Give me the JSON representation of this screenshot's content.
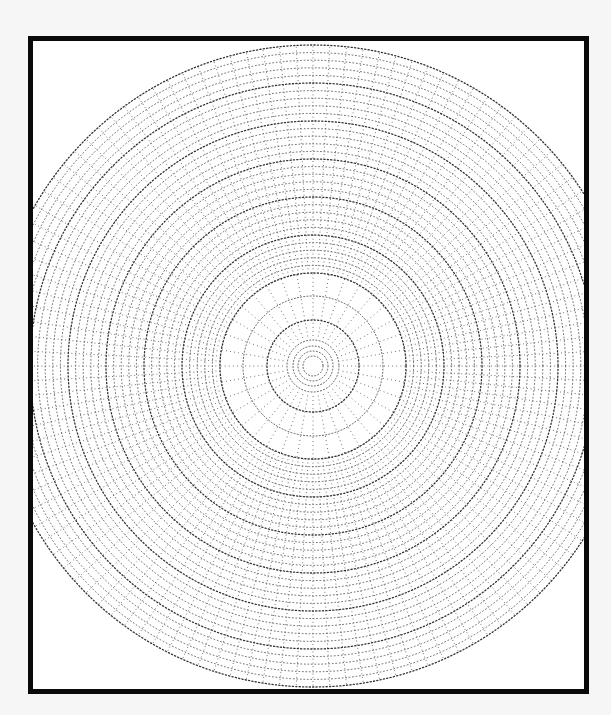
{
  "diagram": {
    "type": "polar-grid",
    "colors": {
      "paper": "#ffffff",
      "background": "#f6f6f6",
      "frame": "#0a0a0a",
      "dots": "#555555",
      "major_dots": "#333333"
    },
    "center": {
      "x": 280,
      "y": 325
    },
    "inner_zone": {
      "radius": 93,
      "radial_count": 36,
      "radial_start": 30,
      "rings": [
        10,
        15,
        20,
        26,
        46,
        70,
        93
      ]
    },
    "outer_zone": {
      "start_radius": 93,
      "end_radius": 322,
      "radial_count": 120,
      "ring_step": 7.6,
      "major_ring_every": 5
    }
  }
}
